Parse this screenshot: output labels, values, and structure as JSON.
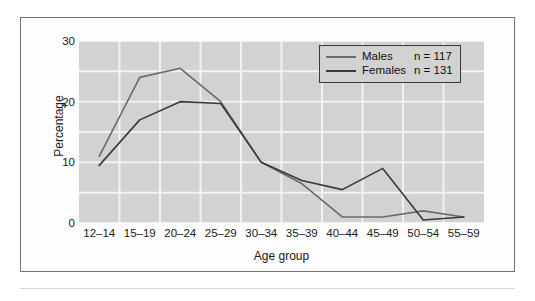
{
  "chart_data": {
    "type": "line",
    "title": "",
    "xlabel": "Age group",
    "ylabel": "Percentage",
    "categories": [
      "12–14",
      "15–19",
      "20–24",
      "25–29",
      "30–34",
      "35–39",
      "40–44",
      "45–49",
      "50–54",
      "55–59"
    ],
    "ylim": [
      0,
      30
    ],
    "yticks": [
      0,
      10,
      20,
      30
    ],
    "grid": true,
    "legend_position": "top-right",
    "series": [
      {
        "name": "Males",
        "n_label": "n = 117",
        "color": "#6b6b6b",
        "values": [
          11,
          24,
          25.5,
          20,
          10,
          6.5,
          1,
          1,
          2,
          1
        ]
      },
      {
        "name": "Females",
        "n_label": "n = 131",
        "color": "#3a3a3a",
        "values": [
          9.5,
          17,
          20,
          19.7,
          10,
          7,
          5.5,
          9,
          0.5,
          1
        ]
      }
    ]
  },
  "axis": {
    "y_tick_labels": [
      "30",
      "20",
      "10",
      "0"
    ],
    "y_title": "Percentage",
    "x_title": "Age group"
  },
  "legend": {
    "rows": [
      {
        "label": "Males",
        "n": "n = 117"
      },
      {
        "label": "Females",
        "n": "n = 131"
      }
    ]
  },
  "colors": {
    "males_line": "#6b6b6b",
    "females_line": "#3a3a3a",
    "plot_background": "#d2d2d2",
    "gridline": "#f2f2f2",
    "frame_border": "#6e7176",
    "text": "#1a1a1a"
  }
}
